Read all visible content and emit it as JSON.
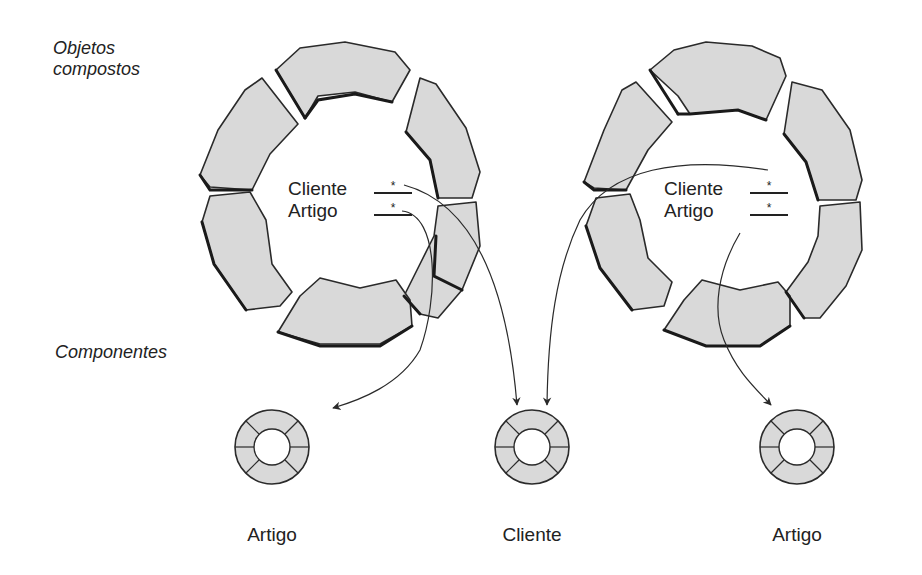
{
  "labels": {
    "composite_objects_line1": "Objetos",
    "composite_objects_line2": "compostos",
    "components": "Componentes"
  },
  "composite_objects": [
    {
      "id": "left",
      "attributes": [
        {
          "name": "Cliente",
          "multiplicity": "*"
        },
        {
          "name": "Artigo",
          "multiplicity": "*"
        }
      ]
    },
    {
      "id": "right",
      "attributes": [
        {
          "name": "Cliente",
          "multiplicity": "*"
        },
        {
          "name": "Artigo",
          "multiplicity": "*"
        }
      ]
    }
  ],
  "components": [
    {
      "name": "Artigo"
    },
    {
      "name": "Cliente"
    },
    {
      "name": "Artigo"
    }
  ],
  "relations": [
    {
      "from": "left.Cliente",
      "to": "components.1 (Cliente)"
    },
    {
      "from": "left.Artigo",
      "to": "components.0 (Artigo)"
    },
    {
      "from": "right.Cliente",
      "to": "components.1 (Cliente)"
    },
    {
      "from": "right.Artigo",
      "to": "components.2 (Artigo)"
    }
  ],
  "colors": {
    "segment_fill": "#d9d9d9",
    "outline": "#2a2a2a",
    "background": "#ffffff"
  }
}
